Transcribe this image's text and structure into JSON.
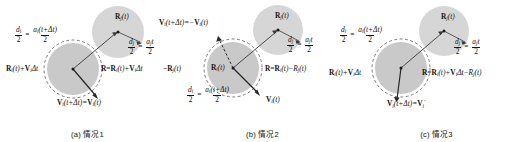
{
  "figure": {
    "type": "diagram",
    "background": "#ffffff",
    "colors": {
      "circle_fill_solid": "#c9c9c9",
      "circle_fill_light": "#d8d8d8",
      "dashed_stroke": "#6f6f6f",
      "vector_stroke": "#2b2b2b",
      "text": "#141414"
    },
    "panels": [
      {
        "id": "a",
        "caption": "(a) 情况1",
        "labels": {
          "upper_circle_center": {
            "base": "R",
            "sub": "j",
            "arg": "(t)"
          },
          "left_position": {
            "text": "R",
            "sub": "i",
            "arg": "(t)+",
            "vec": "V",
            "vec_sub": "i",
            "tail": "Δt"
          },
          "right_position": {
            "lead": "R=R",
            "sub": "i",
            "arg": "(t)+",
            "vec": "V",
            "vec_sub": "i",
            "tail": "Δt"
          },
          "velocity": {
            "vec": "V",
            "vec_sub": "i",
            "arg": "(t+Δt)=",
            "vec2": "V",
            "vec2_sub": "i",
            "arg2": "(t)"
          },
          "fraction_left": {
            "num_d": "d",
            "num_sub": "i",
            "den": "2",
            "rhs_num": "a",
            "rhs_sub": "i",
            "rhs_arg": "(t+Δt)",
            "rhs_den": "2"
          },
          "fraction_right": {
            "num_d": "d",
            "num_sub": "j",
            "den": "2",
            "rhs_num": "a",
            "rhs_sub": "j",
            "rhs_arg": "t",
            "rhs_den": "2"
          }
        }
      },
      {
        "id": "b",
        "caption": "(b) 情况2",
        "labels": {
          "upper_circle_center": {
            "base": "R",
            "sub": "j",
            "arg": "(t)"
          },
          "inner_circle_center": {
            "base": "R",
            "sub": "i",
            "arg": "(t)"
          },
          "velocity_top": {
            "vec": "V",
            "vec_sub": "i",
            "arg": "(t+Δt)=−",
            "vec2": "V",
            "vec2_sub": "i",
            "arg2": "(t)"
          },
          "left_position": {
            "lead": "−R",
            "sub": "j",
            "arg": "(t)"
          },
          "right_position": {
            "lead": "R=R",
            "sub": "i",
            "arg": "(t)−R",
            "sub2": "j",
            "arg2": "(t)"
          },
          "velocity_bottom": {
            "vec": "V",
            "vec_sub": "i",
            "arg": "(t)"
          },
          "fraction_left": {
            "num_d": "d",
            "num_sub": "i",
            "den": "2",
            "rhs_num": "a",
            "rhs_sub": "i",
            "rhs_arg": "(t+Δt)",
            "rhs_den": "2"
          },
          "fraction_right": {
            "num_d": "d",
            "num_sub": "j",
            "den": "2",
            "rhs_num": "a",
            "rhs_sub": "j",
            "rhs_arg": "t",
            "rhs_den": "2"
          }
        }
      },
      {
        "id": "c",
        "caption": "(c) 情况3",
        "labels": {
          "upper_circle_center": {
            "base": "R",
            "sub": "j",
            "arg": "(t)"
          },
          "left_position": {
            "text": "R",
            "sub": "i",
            "arg": "(t)+",
            "vec": "V",
            "vec_sub": "i",
            "tail": "Δt"
          },
          "right_position": {
            "lead": "R=R",
            "sub": "i",
            "arg": "(t)+",
            "vec": "V",
            "vec_sub": "i",
            "mid": "Δt−R",
            "sub2": "j",
            "arg2": "(t)"
          },
          "velocity": {
            "vec": "V",
            "vec_sub": "i",
            "arg": "(t+Δt)=",
            "vec2": "V",
            "vec2_sub": "i",
            "prime": "′"
          },
          "fraction_left": {
            "num_d": "d",
            "num_sub": "i",
            "den": "2",
            "rhs_num": "a",
            "rhs_sub": "i",
            "rhs_arg": "(t+Δt)",
            "rhs_den": "2"
          },
          "fraction_right": {
            "num_d": "d",
            "num_sub": "j",
            "den": "2",
            "rhs_num": "a",
            "rhs_sub": "j",
            "rhs_arg": "t",
            "rhs_den": "2"
          }
        }
      }
    ]
  }
}
